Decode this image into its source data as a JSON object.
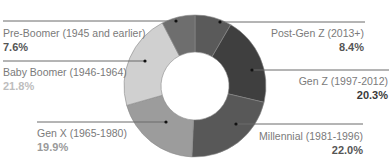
{
  "chart_data": {
    "type": "pie",
    "variant": "donut",
    "title": "",
    "start_angle": "12 o'clock, clockwise",
    "categories": [
      "Post-Gen Z (2013+)",
      "Gen Z (1997-2012)",
      "Millennial (1981-1996)",
      "Gen X (1965-1980)",
      "Baby Boomer (1946-1964)",
      "Pre-Boomer (1945 and earlier)"
    ],
    "values": [
      8.4,
      20.3,
      22.0,
      19.9,
      21.8,
      7.6
    ],
    "unit": "%",
    "legend": "leader-line labels",
    "colors": [
      "#5a5a5a",
      "#3f3f3f",
      "#585858",
      "#9c9c9c",
      "#d0d0d0",
      "#6e6e6e"
    ]
  },
  "labels": [
    {
      "name": "Post-Gen Z (2013+)",
      "value": "8.4%",
      "side": "right",
      "pct_color": "#555555"
    },
    {
      "name": "Gen Z (1997-2012)",
      "value": "20.3%",
      "side": "right",
      "pct_color": "#3a3a3a"
    },
    {
      "name": "Millennial (1981-1996)",
      "value": "22.0%",
      "side": "right",
      "pct_color": "#555555"
    },
    {
      "name": "Gen X (1965-1980)",
      "value": "19.9%",
      "side": "left",
      "pct_color": "#9a9a9a"
    },
    {
      "name": "Baby Boomer (1946-1964)",
      "value": "21.8%",
      "side": "left",
      "pct_color": "#bdbdbd"
    },
    {
      "name": "Pre-Boomer (1945 and earlier)",
      "value": "7.6%",
      "side": "left",
      "pct_color": "#555555"
    }
  ]
}
